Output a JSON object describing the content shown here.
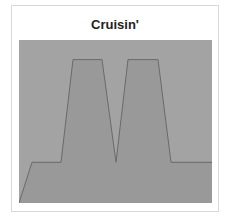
{
  "card": {
    "title": "Cruisin'"
  },
  "colors": {
    "background_fill": "#a3a3a3",
    "area_fill": "#999999",
    "line": "#6a6a6a"
  },
  "chart_data": {
    "type": "area",
    "title": "Cruisin'",
    "xlabel": "",
    "ylabel": "",
    "grid": false,
    "legend": null,
    "x": [
      0,
      13,
      42,
      54,
      83,
      97,
      109,
      139,
      152,
      193
    ],
    "values": [
      0,
      25,
      25,
      88,
      88,
      25,
      88,
      88,
      25,
      25
    ],
    "xlim": [
      0,
      193
    ],
    "ylim": [
      0,
      100
    ]
  }
}
